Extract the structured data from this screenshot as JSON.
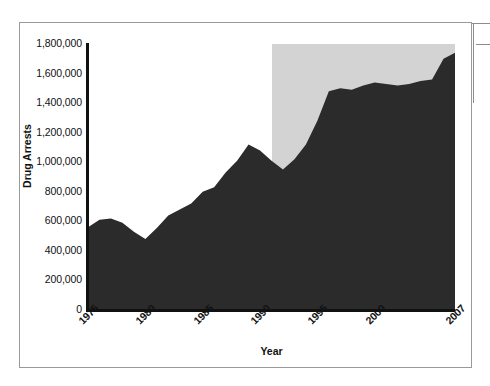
{
  "figure": {
    "frame_color": "#9a9a9a",
    "background": "#ffffff"
  },
  "chart_data": {
    "type": "area",
    "title": "",
    "subtitle": "",
    "xlabel": "Year",
    "ylabel": "Drug Arrests",
    "grid": false,
    "legend": null,
    "series_color": "#2b2b2b",
    "shaded_band_color": "#d3d3d3",
    "xlim": [
      1975,
      2007
    ],
    "ylim": [
      0,
      1800000
    ],
    "ytick_labels": [
      "1,800,000",
      "1,600,000",
      "1,400,000",
      "1,200,000",
      "1,000,000",
      "800,000",
      "600,000",
      "400,000",
      "200,000",
      "0"
    ],
    "ytick_values": [
      1800000,
      1600000,
      1400000,
      1200000,
      1000000,
      800000,
      600000,
      400000,
      200000,
      0
    ],
    "xtick_labels": [
      "1975",
      "1980",
      "1985",
      "1990",
      "1995",
      "2000",
      "2007"
    ],
    "xtick_values": [
      1975,
      1980,
      1985,
      1990,
      1995,
      2000,
      2007
    ],
    "shaded_band_range": [
      1991,
      2007
    ],
    "x": [
      1975,
      1976,
      1977,
      1978,
      1979,
      1980,
      1981,
      1982,
      1983,
      1984,
      1985,
      1986,
      1987,
      1988,
      1989,
      1990,
      1991,
      1992,
      1993,
      1994,
      1995,
      1996,
      1997,
      1998,
      1999,
      2000,
      2001,
      2002,
      2003,
      2004,
      2005,
      2006,
      2007
    ],
    "values": [
      560000,
      610000,
      620000,
      590000,
      530000,
      480000,
      555000,
      640000,
      680000,
      720000,
      800000,
      830000,
      930000,
      1010000,
      1120000,
      1080000,
      1010000,
      950000,
      1020000,
      1120000,
      1280000,
      1480000,
      1500000,
      1490000,
      1520000,
      1540000,
      1530000,
      1520000,
      1530000,
      1550000,
      1560000,
      1700000,
      1740000
    ]
  },
  "artifacts": {
    "right_rule_vertical": "scan-edge-rule",
    "top_rule_horizontal": "scan-edge-rule-top",
    "mid_rule_horizontal": "scan-edge-rule-mid"
  }
}
